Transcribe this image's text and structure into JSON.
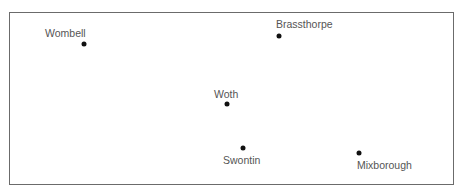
{
  "map": {
    "places": [
      {
        "name": "Wombell",
        "dot": [
          84,
          44
        ],
        "label": [
          45,
          28
        ]
      },
      {
        "name": "Brassthorpe",
        "dot": [
          279,
          36
        ],
        "label": [
          276,
          19
        ]
      },
      {
        "name": "Woth",
        "dot": [
          227,
          104
        ],
        "label": [
          214,
          89
        ]
      },
      {
        "name": "Swontin",
        "dot": [
          243,
          148
        ],
        "label": [
          223,
          155
        ]
      },
      {
        "name": "Mixborough",
        "dot": [
          359,
          153
        ],
        "label": [
          357,
          160
        ]
      }
    ]
  }
}
